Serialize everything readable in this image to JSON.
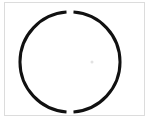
{
  "figure": {
    "title": "Circle outline with gaps",
    "background_color": "#ffffff",
    "frame_color": "#dcdcdc",
    "stroke_color": "#111111"
  },
  "chart_data": {
    "type": "scatter",
    "title": "",
    "subtitle": "",
    "xlabel": "",
    "ylabel": "",
    "grid": false,
    "legend_position": "none",
    "shapes": [
      {
        "name": "circle-arc-primary",
        "kind": "arc",
        "center_x": 70,
        "center_y": 62,
        "radius": 50,
        "start_angle_deg": 94,
        "end_angle_deg": 266,
        "stroke_color": "#111111",
        "stroke_width": 3,
        "fill": "none"
      },
      {
        "name": "circle-arc-secondary",
        "kind": "arc",
        "center_x": 70,
        "center_y": 62,
        "radius": 50,
        "start_angle_deg": 274,
        "end_angle_deg": 86,
        "stroke_color": "#111111",
        "stroke_width": 3,
        "fill": "none"
      },
      {
        "name": "center-speck",
        "kind": "point",
        "center_x": 92,
        "center_y": 62,
        "radius": 1.5,
        "stroke_color": "#e2e2e2",
        "fill": "#e2e2e2"
      }
    ],
    "gaps": [
      {
        "name": "top-gap",
        "angle_deg": 90,
        "x": 70,
        "y": 12,
        "width_px": 6
      },
      {
        "name": "bottom-gap",
        "angle_deg": 270,
        "x": 70,
        "y": 112,
        "width_px": 7
      }
    ],
    "axis_ranges": {
      "xlim": [
        0,
        149
      ],
      "ylim": [
        0,
        123
      ]
    },
    "tick_labels": {
      "x": [],
      "y": []
    },
    "annotations": []
  }
}
